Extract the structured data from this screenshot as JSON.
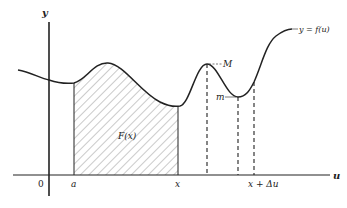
{
  "diagram": {
    "axes": {
      "x_label": "u",
      "y_label": "y",
      "origin_label": "0"
    },
    "curve_label": "y = f(u)",
    "area_label": "F(x)",
    "tick_labels": {
      "a": "a",
      "x": "x",
      "x_plus_du": "x + Δu"
    },
    "extrema_labels": {
      "max": "M",
      "min": "m"
    },
    "colors": {
      "ink": "#222222",
      "hatch": "#555555",
      "background": "#ffffff"
    }
  }
}
